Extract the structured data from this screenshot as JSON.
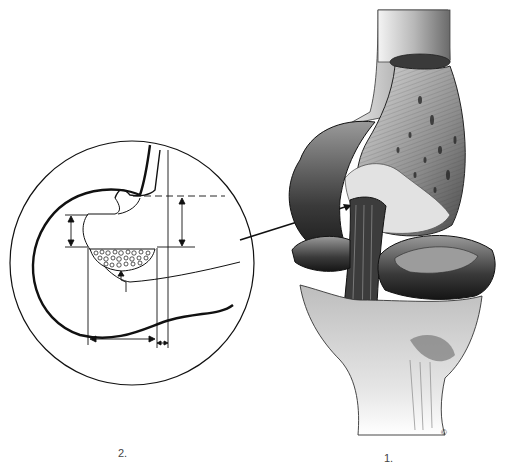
{
  "figure": {
    "panels": [
      {
        "id": "2",
        "label": "2.",
        "description": "Circular inset schematic cross-section with dimension arrows and dashed reference line"
      },
      {
        "id": "1",
        "label": "1.",
        "description": "Shaded illustration of knee joint: femoral condyle, menisci, ligament, tibia"
      }
    ],
    "copyright_mark": "©",
    "colors": {
      "ink": "#111111",
      "background": "#ffffff",
      "shade_dark": "#2a2a2a",
      "shade_mid": "#7a7a7a",
      "shade_light": "#cfcfcf"
    }
  }
}
